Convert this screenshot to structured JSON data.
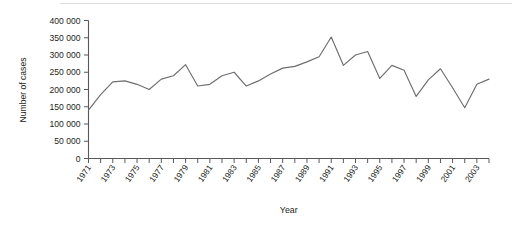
{
  "chart_data": {
    "type": "line",
    "title": "",
    "xlabel": "Year",
    "ylabel": "Number of cases",
    "xlim": [
      1971,
      2004
    ],
    "ylim": [
      0,
      400000
    ],
    "grid": false,
    "legend": null,
    "y_ticks": [
      0,
      50000,
      100000,
      150000,
      200000,
      250000,
      300000,
      350000,
      400000
    ],
    "y_tick_labels": [
      "0",
      "50 000",
      "100 000",
      "150 000",
      "200 000",
      "250 000",
      "300 000",
      "350 000",
      "400 000"
    ],
    "x_ticks": [
      1971,
      1972,
      1973,
      1974,
      1975,
      1976,
      1977,
      1978,
      1979,
      1980,
      1981,
      1982,
      1983,
      1984,
      1985,
      1986,
      1987,
      1988,
      1989,
      1990,
      1991,
      1992,
      1993,
      1994,
      1995,
      1996,
      1997,
      1998,
      1999,
      2000,
      2001,
      2002,
      2003,
      2004
    ],
    "x_tick_labels": [
      "1971",
      "1973",
      "1975",
      "1977",
      "1979",
      "1981",
      "1983",
      "1985",
      "1987",
      "1989",
      "1991",
      "1993",
      "1995",
      "1997",
      "1999",
      "2001",
      "2003"
    ],
    "x_tick_label_years": [
      1971,
      1973,
      1975,
      1977,
      1979,
      1981,
      1983,
      1985,
      1987,
      1989,
      1991,
      1993,
      1995,
      1997,
      1999,
      2001,
      2003
    ],
    "series": [
      {
        "name": "Number of cases",
        "color": "#6d6e71",
        "x": [
          1971,
          1972,
          1973,
          1974,
          1975,
          1976,
          1977,
          1978,
          1979,
          1980,
          1981,
          1982,
          1983,
          1984,
          1985,
          1986,
          1987,
          1988,
          1989,
          1990,
          1991,
          1992,
          1993,
          1994,
          1995,
          1996,
          1997,
          1998,
          1999,
          2000,
          2001,
          2002,
          2003,
          2004
        ],
        "values": [
          140000,
          185000,
          222000,
          225000,
          215000,
          200000,
          230000,
          240000,
          272000,
          210000,
          215000,
          240000,
          250000,
          210000,
          225000,
          245000,
          262000,
          267000,
          280000,
          295000,
          352000,
          270000,
          300000,
          310000,
          232000,
          270000,
          256000,
          180000,
          228000,
          260000,
          205000,
          147000,
          215000,
          230000
        ],
        "style": "solid"
      }
    ]
  },
  "axis": {
    "y_axis_title": "Number of cases",
    "x_axis_title": "Year"
  }
}
